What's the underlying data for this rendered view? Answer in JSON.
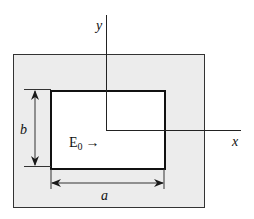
{
  "diagram": {
    "type": "rectangular-aperture",
    "colors": {
      "background": "#ffffff",
      "outer_region": "#ededed",
      "inner_region": "#ffffff",
      "lines": "#1a1a1a"
    },
    "axes": {
      "x_label": "x",
      "y_label": "y"
    },
    "dimensions": {
      "width_label": "a",
      "height_label": "b"
    },
    "field": {
      "label_base": "E",
      "label_subscript": "0",
      "arrow": "→"
    }
  }
}
